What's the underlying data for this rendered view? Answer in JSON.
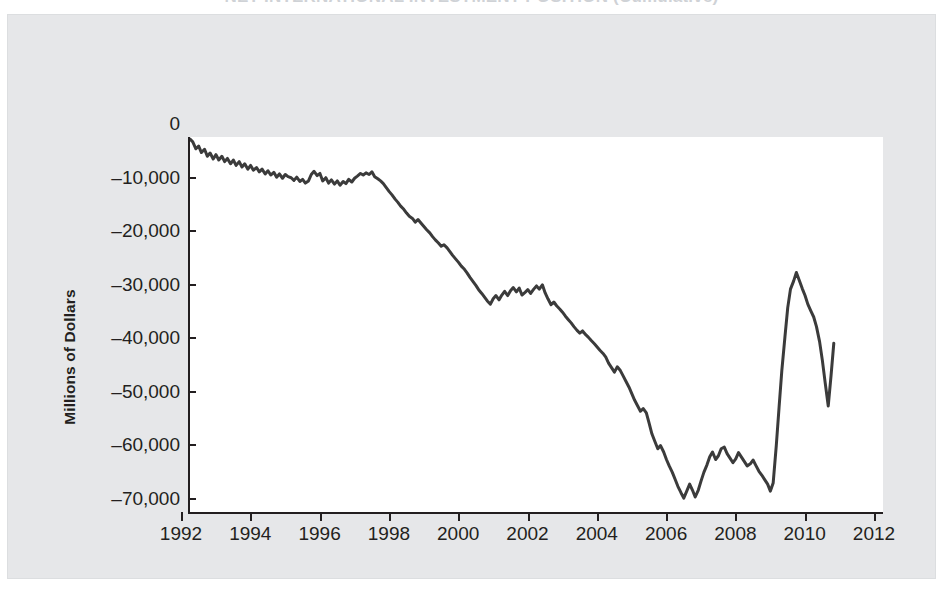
{
  "figure": {
    "title": "NET INTERNATIONAL INVESTMENT POSITION (Cumulative)",
    "background_color": "#e6e7e9",
    "plot_background_color": "#ffffff",
    "line_color": "#3b3b3b",
    "axis_color": "#231f20"
  },
  "chart_data": {
    "type": "line",
    "title": "NET INTERNATIONAL INVESTMENT POSITION (Cumulative)",
    "xlabel": "",
    "ylabel": "Millions of Dollars",
    "xlim": [
      1992,
      2012
    ],
    "ylim": [
      -70000,
      0
    ],
    "grid": false,
    "legend": null,
    "x_tick_labels": [
      "1992",
      "1994",
      "1996",
      "1998",
      "2000",
      "2002",
      "2004",
      "2006",
      "2008",
      "2010",
      "2012"
    ],
    "x_ticks": [
      1992,
      1994,
      1996,
      1998,
      2000,
      2002,
      2004,
      2006,
      2008,
      2010,
      2012
    ],
    "y_tick_labels": [
      "0",
      "–10,000",
      "–20,000",
      "–30,000",
      "–40,000",
      "–50,000",
      "–60,000",
      "–70,000"
    ],
    "y_ticks": [
      0,
      -10000,
      -20000,
      -30000,
      -40000,
      -50000,
      -60000,
      -70000
    ],
    "units": "Millions of Dollars",
    "series": [
      {
        "name": "Net international investment position",
        "x": [
          1992.0,
          1992.08,
          1992.17,
          1992.25,
          1992.33,
          1992.42,
          1992.5,
          1992.58,
          1992.67,
          1992.75,
          1992.83,
          1992.92,
          1993.0,
          1993.08,
          1993.17,
          1993.25,
          1993.33,
          1993.42,
          1993.5,
          1993.58,
          1993.67,
          1993.75,
          1993.83,
          1993.92,
          1994.0,
          1994.08,
          1994.17,
          1994.25,
          1994.33,
          1994.42,
          1994.5,
          1994.58,
          1994.67,
          1994.75,
          1994.83,
          1994.92,
          1995.0,
          1995.08,
          1995.17,
          1995.25,
          1995.33,
          1995.42,
          1995.5,
          1995.58,
          1995.67,
          1995.75,
          1995.83,
          1995.92,
          1996.0,
          1996.08,
          1996.17,
          1996.25,
          1996.33,
          1996.42,
          1996.5,
          1996.58,
          1996.67,
          1996.75,
          1996.83,
          1996.92,
          1997.0,
          1997.08,
          1997.17,
          1997.25,
          1997.33,
          1997.42,
          1997.5,
          1997.58,
          1997.67,
          1997.75,
          1997.83,
          1997.92,
          1998.0,
          1998.08,
          1998.17,
          1998.25,
          1998.33,
          1998.42,
          1998.5,
          1998.58,
          1998.67,
          1998.75,
          1998.83,
          1998.92,
          1999.0,
          1999.08,
          1999.17,
          1999.25,
          1999.33,
          1999.42,
          1999.5,
          1999.58,
          1999.67,
          1999.75,
          1999.83,
          1999.92,
          2000.0,
          2000.08,
          2000.17,
          2000.25,
          2000.33,
          2000.42,
          2000.5,
          2000.58,
          2000.67,
          2000.75,
          2000.83,
          2000.92,
          2001.0,
          2001.08,
          2001.17,
          2001.25,
          2001.33,
          2001.42,
          2001.5,
          2001.58,
          2001.67,
          2001.75,
          2001.83,
          2001.92,
          2002.0,
          2002.08,
          2002.17,
          2002.25,
          2002.33,
          2002.42,
          2002.5,
          2002.58,
          2002.67,
          2002.75,
          2002.83,
          2002.92,
          2003.0,
          2003.08,
          2003.17,
          2003.25,
          2003.33,
          2003.42,
          2003.5,
          2003.58,
          2003.67,
          2003.75,
          2003.83,
          2003.92,
          2004.0,
          2004.08,
          2004.17,
          2004.25,
          2004.33,
          2004.42,
          2004.5,
          2004.58,
          2004.67,
          2004.75,
          2004.83,
          2004.92,
          2005.0,
          2005.08,
          2005.17,
          2005.25,
          2005.33,
          2005.42,
          2005.5,
          2005.58,
          2005.67,
          2005.75,
          2005.83,
          2005.92,
          2006.0,
          2006.08,
          2006.17,
          2006.25,
          2006.33,
          2006.42,
          2006.5,
          2006.58,
          2006.67,
          2006.75,
          2006.83,
          2006.92,
          2007.0,
          2007.08,
          2007.17,
          2007.25,
          2007.33,
          2007.42,
          2007.5,
          2007.58,
          2007.67,
          2007.75,
          2007.83,
          2007.92,
          2008.0,
          2008.08,
          2008.17,
          2008.25,
          2008.33,
          2008.42,
          2008.5,
          2008.58,
          2008.67,
          2008.75,
          2008.83,
          2008.92,
          2009.0,
          2009.08,
          2009.17,
          2009.25,
          2009.33,
          2009.42,
          2009.5,
          2009.58,
          2009.67,
          2009.75,
          2009.83,
          2009.92,
          2010.0,
          2010.08,
          2010.17,
          2010.25,
          2010.33,
          2010.42,
          2010.5,
          2010.58
        ],
        "y": [
          -400,
          -900,
          -2200,
          -1700,
          -2900,
          -2300,
          -3600,
          -3000,
          -4100,
          -3300,
          -4300,
          -3600,
          -4600,
          -4000,
          -5000,
          -4300,
          -5300,
          -4600,
          -5600,
          -5000,
          -6000,
          -5300,
          -6200,
          -5700,
          -6500,
          -6000,
          -6900,
          -6300,
          -7100,
          -6600,
          -7500,
          -6900,
          -7700,
          -7000,
          -7400,
          -7600,
          -8100,
          -7500,
          -8300,
          -7900,
          -8600,
          -8200,
          -7000,
          -6400,
          -7200,
          -6800,
          -8200,
          -7600,
          -8600,
          -8000,
          -8800,
          -8200,
          -9000,
          -8300,
          -8700,
          -7900,
          -8400,
          -7700,
          -7300,
          -6800,
          -7100,
          -6700,
          -7000,
          -6500,
          -7400,
          -7800,
          -8200,
          -8700,
          -9500,
          -10200,
          -10800,
          -11600,
          -12200,
          -12900,
          -13500,
          -14200,
          -14800,
          -15200,
          -15900,
          -15400,
          -16100,
          -16700,
          -17300,
          -17900,
          -18600,
          -19200,
          -19800,
          -20400,
          -20100,
          -20700,
          -21400,
          -22100,
          -22800,
          -23400,
          -24100,
          -24700,
          -25400,
          -26200,
          -27000,
          -27700,
          -28500,
          -29200,
          -29900,
          -30600,
          -31200,
          -30200,
          -29600,
          -30400,
          -29500,
          -28800,
          -29600,
          -28700,
          -28100,
          -28900,
          -28200,
          -29500,
          -29000,
          -28500,
          -29200,
          -28400,
          -27800,
          -28400,
          -27600,
          -29100,
          -30200,
          -31300,
          -30800,
          -31500,
          -32100,
          -32700,
          -33400,
          -34100,
          -34700,
          -35400,
          -36100,
          -36600,
          -36200,
          -36900,
          -37400,
          -38000,
          -38600,
          -39200,
          -39800,
          -40400,
          -41100,
          -42200,
          -43100,
          -43900,
          -42900,
          -43600,
          -44600,
          -45600,
          -46700,
          -47900,
          -49100,
          -50200,
          -51200,
          -50700,
          -51500,
          -53400,
          -55400,
          -56900,
          -58200,
          -57600,
          -58800,
          -60200,
          -61400,
          -62600,
          -63900,
          -65200,
          -66400,
          -67400,
          -66200,
          -64800,
          -65900,
          -67200,
          -65900,
          -64200,
          -62600,
          -61200,
          -59700,
          -58800,
          -60200,
          -59500,
          -58200,
          -57900,
          -59100,
          -59900,
          -60800,
          -60100,
          -58900,
          -59800,
          -60600,
          -61400,
          -61000,
          -60300,
          -61300,
          -62400,
          -63100,
          -63900,
          -64800,
          -66100,
          -64600,
          -57600,
          -50500,
          -43600,
          -37300,
          -31900,
          -28400,
          -26900,
          -25300,
          -26700,
          -28300,
          -29600,
          -31200,
          -32500,
          -33600,
          -35400,
          -38200,
          -41700,
          -45800,
          -50200,
          -44600,
          -38500
        ]
      }
    ],
    "annotations": [
      {
        "label": "series low",
        "x": 2006.25,
        "y": -67400
      },
      {
        "label": "post-2008 peak",
        "x": 2009.5,
        "y": -25300
      },
      {
        "label": "series end",
        "x": 2010.58,
        "y": -38500
      }
    ]
  },
  "axes": {
    "y_title": "Millions of Dollars",
    "y_ticks": [
      {
        "label": "0",
        "value": 0
      },
      {
        "label": "–10,000",
        "value": -10000
      },
      {
        "label": "–20,000",
        "value": -20000
      },
      {
        "label": "–30,000",
        "value": -30000
      },
      {
        "label": "–40,000",
        "value": -40000
      },
      {
        "label": "–50,000",
        "value": -50000
      },
      {
        "label": "–60,000",
        "value": -60000
      },
      {
        "label": "–70,000",
        "value": -70000
      }
    ],
    "x_ticks": [
      {
        "label": "1992",
        "value": 1992
      },
      {
        "label": "1994",
        "value": 1994
      },
      {
        "label": "1996",
        "value": 1996
      },
      {
        "label": "1998",
        "value": 1998
      },
      {
        "label": "2000",
        "value": 2000
      },
      {
        "label": "2002",
        "value": 2002
      },
      {
        "label": "2004",
        "value": 2004
      },
      {
        "label": "2006",
        "value": 2006
      },
      {
        "label": "2008",
        "value": 2008
      },
      {
        "label": "2010",
        "value": 2010
      },
      {
        "label": "2012",
        "value": 2012
      }
    ]
  },
  "ghosts": {
    "left": "",
    "center": ""
  }
}
